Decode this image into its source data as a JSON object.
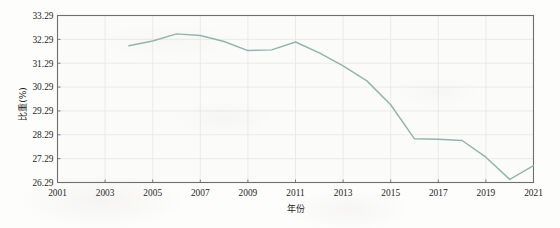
{
  "chart_data": {
    "type": "line",
    "title": "",
    "xlabel": "年份",
    "ylabel": "比重(%)",
    "xlim": [
      2001,
      2021
    ],
    "ylim": [
      26.29,
      33.29
    ],
    "grid": true,
    "legend": "none",
    "line_color": "#8fb6ae",
    "background_color": "#fbfbf9",
    "axis_color": "#6e6e6e",
    "grid_color": "#e6e6e2",
    "xticks": [
      "2001",
      "2003",
      "2005",
      "2007",
      "2009",
      "2011",
      "2013",
      "2015",
      "2017",
      "2019",
      "2021"
    ],
    "yticks": [
      "26.29",
      "27.29",
      "28.29",
      "29.29",
      "30.29",
      "31.29",
      "32.29",
      "33.29"
    ],
    "x": [
      2004,
      2005,
      2006,
      2007,
      2008,
      2009,
      2010,
      2011,
      2012,
      2013,
      2014,
      2015,
      2016,
      2017,
      2018,
      2019,
      2020,
      2021
    ],
    "values": [
      32.02,
      32.22,
      32.52,
      32.45,
      32.2,
      31.82,
      31.85,
      32.18,
      31.72,
      31.18,
      30.55,
      29.55,
      28.12,
      28.1,
      28.05,
      27.35,
      26.42,
      27.0
    ],
    "series": [
      {
        "name": "比重(%)",
        "values": [
          32.02,
          32.22,
          32.52,
          32.45,
          32.2,
          31.82,
          31.85,
          32.18,
          31.72,
          31.18,
          30.55,
          29.55,
          28.12,
          28.1,
          28.05,
          27.35,
          26.42,
          27.0
        ]
      }
    ]
  }
}
